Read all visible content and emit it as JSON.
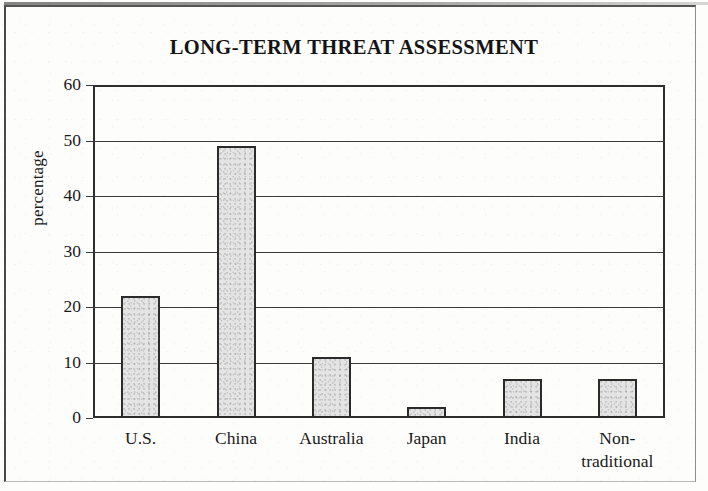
{
  "chart_data": {
    "type": "bar",
    "title": "LONG-TERM THREAT ASSESSMENT",
    "xlabel": "",
    "ylabel": "percentage",
    "categories": [
      "U.S.",
      "China",
      "Australia",
      "Japan",
      "India",
      "Non-traditional"
    ],
    "values": [
      22,
      49,
      11,
      2,
      7,
      7
    ],
    "ylim": [
      0,
      60
    ],
    "ytick_step": 10,
    "yticks": [
      "0",
      "10",
      "20",
      "30",
      "40",
      "50",
      "60"
    ],
    "grid": true,
    "legend": null,
    "bar_fill_color": "#e4e4e4",
    "bar_edge_color": "#2b2b2b",
    "axis_color": "#2e2e2e",
    "background_color": "#fdfdfc"
  },
  "axis": {
    "y_title": "percentage",
    "ticks": [
      {
        "label": "60",
        "value": 60
      },
      {
        "label": "50",
        "value": 50
      },
      {
        "label": "40",
        "value": 40
      },
      {
        "label": "30",
        "value": 30
      },
      {
        "label": "20",
        "value": 20
      },
      {
        "label": "10",
        "value": 10
      },
      {
        "label": "0",
        "value": 0
      }
    ]
  },
  "bars": [
    {
      "label": "U.S.",
      "label_line2": "",
      "value": 22
    },
    {
      "label": "China",
      "label_line2": "",
      "value": 49
    },
    {
      "label": "Australia",
      "label_line2": "",
      "value": 11
    },
    {
      "label": "Japan",
      "label_line2": "",
      "value": 2
    },
    {
      "label": "India",
      "label_line2": "",
      "value": 7
    },
    {
      "label": "Non-",
      "label_line2": "traditional",
      "value": 7
    }
  ]
}
